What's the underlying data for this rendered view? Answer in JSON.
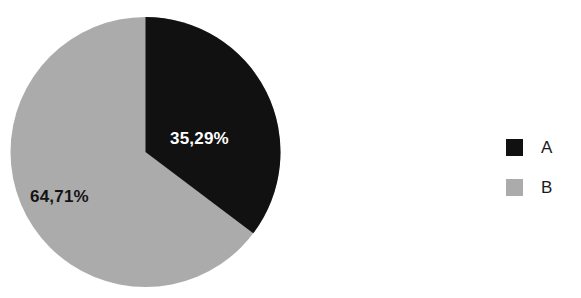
{
  "chart_data": {
    "type": "pie",
    "title": "",
    "categories": [
      "A",
      "B"
    ],
    "values": [
      35.29,
      64.71
    ],
    "value_labels": [
      "35,29%",
      "64,71%"
    ],
    "colors": [
      "#111111",
      "#ababab"
    ],
    "legend_position": "right",
    "start_angle_deg": 0,
    "direction": "clockwise",
    "decimal_separator": ",",
    "units": "%"
  },
  "pie": {
    "slices": [
      {
        "name": "A",
        "label": "35,29%",
        "value": 35.29,
        "color": "#111111",
        "label_color": "#ffffff"
      },
      {
        "name": "B",
        "label": "64,71%",
        "value": 64.71,
        "color": "#ababab",
        "label_color": "#141414"
      }
    ]
  },
  "legend": {
    "items": [
      {
        "label": "A",
        "color": "#111111"
      },
      {
        "label": "B",
        "color": "#ababab"
      }
    ]
  },
  "title_clip": ""
}
